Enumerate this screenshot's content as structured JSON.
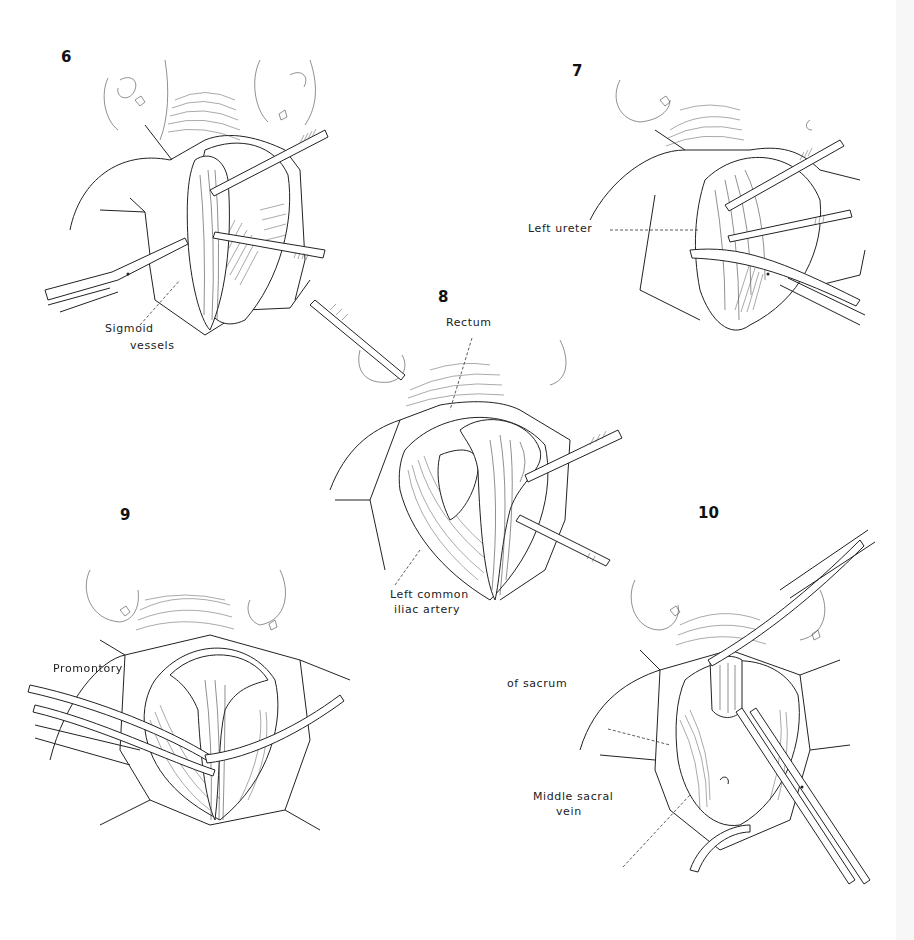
{
  "figure": {
    "panels": [
      {
        "number": "6",
        "labels": [
          "Sigmoid",
          "vessels"
        ]
      },
      {
        "number": "7",
        "labels": [
          "Left ureter"
        ]
      },
      {
        "number": "8",
        "labels": [
          "Rectum",
          "Left common",
          "iliac artery"
        ]
      },
      {
        "number": "9",
        "labels": []
      },
      {
        "number": "10",
        "labels": [
          "Promontory",
          "of sacrum",
          "Middle sacral",
          "vein"
        ]
      }
    ]
  },
  "colors": {
    "ink": "#222222",
    "background": "#ffffff",
    "edge_strip": "#f7f7f7"
  }
}
